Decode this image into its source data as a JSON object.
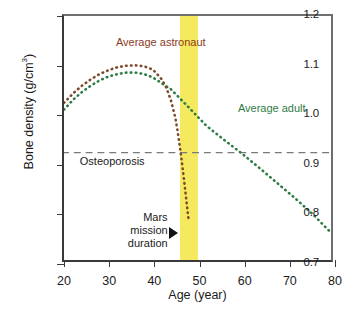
{
  "chart_data": {
    "type": "line",
    "title": "",
    "xlabel": "Age (year)",
    "ylabel": "Bone density (g/cm3)",
    "ylabel_text": "Bone density (g/cm",
    "ylabel_sup": "3",
    "ylabel_tail": ")",
    "xlim": [
      20,
      80
    ],
    "ylim": [
      0.7,
      1.2
    ],
    "xticks": [
      20,
      30,
      40,
      50,
      60,
      70,
      80
    ],
    "xtick_labels": [
      "20",
      "30",
      "40",
      "50",
      "60",
      "70",
      "80"
    ],
    "yticks": [
      0.7,
      0.8,
      0.9,
      1.0,
      1.1,
      1.2
    ],
    "ytick_labels": [
      "0.7",
      "0.8",
      "0.9",
      "1.0",
      "1.1",
      "1.2"
    ],
    "grid": false,
    "legend_position": "inline-annotations",
    "series": [
      {
        "name": "Average astronaut",
        "color": "#7d4a2a",
        "style": "dotted",
        "label_text": "Average astronaut",
        "x": [
          20,
          22,
          24,
          26,
          28,
          30,
          32,
          34,
          36,
          38,
          40,
          42,
          43,
          44,
          45,
          45.5,
          46,
          46.5,
          47,
          47.5,
          48
        ],
        "y": [
          1.022,
          1.041,
          1.057,
          1.07,
          1.081,
          1.089,
          1.095,
          1.098,
          1.099,
          1.097,
          1.09,
          1.07,
          1.053,
          1.028,
          0.992,
          0.966,
          0.934,
          0.9,
          0.862,
          0.822,
          0.782
        ]
      },
      {
        "name": "Average adult",
        "color": "#2f7d46",
        "style": "dotted",
        "label_text": "Average adult",
        "x": [
          20,
          22,
          24,
          26,
          28,
          30,
          32,
          34,
          36,
          38,
          40,
          44,
          48,
          52,
          56,
          60,
          64,
          68,
          72,
          76,
          80
        ],
        "y": [
          1.008,
          1.028,
          1.044,
          1.057,
          1.068,
          1.076,
          1.081,
          1.084,
          1.084,
          1.081,
          1.074,
          1.05,
          1.013,
          0.975,
          0.946,
          0.918,
          0.888,
          0.857,
          0.826,
          0.793,
          0.756
        ]
      }
    ],
    "threshold_line": {
      "name": "Osteoporosis",
      "label": "Osteoporosis",
      "value": 0.92,
      "style": "dashed",
      "color": "#7a7a7a"
    },
    "shaded_band": {
      "name": "Mars mission duration",
      "label_lines": [
        "Mars",
        "mission",
        "duration"
      ],
      "x_start": 45.6,
      "x_end": 49.6,
      "color": "#f5e960",
      "marker": "right-triangle"
    },
    "annotations": [
      {
        "text": "Average astronaut",
        "x": 31.5,
        "y": 1.145,
        "color": "#8a3b1e"
      },
      {
        "text": "Average adult",
        "x": 58.5,
        "y": 1.012,
        "color": "#2f7d46"
      },
      {
        "text": "Osteoporosis",
        "x": 23.5,
        "y": 0.905,
        "color": "#1a1a1a"
      }
    ]
  },
  "axis": {
    "x_title": "Age (year)",
    "y_title_main": "Bone density (g/cm",
    "y_title_sup": "3",
    "y_title_close": ")"
  },
  "labels": {
    "astronaut": "Average astronaut",
    "adult": "Average adult",
    "osteoporosis": "Osteoporosis",
    "mars_line1": "Mars",
    "mars_line2": "mission",
    "mars_line3": "duration"
  }
}
